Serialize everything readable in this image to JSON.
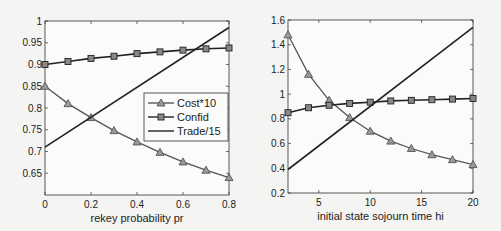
{
  "chart_data": [
    {
      "type": "line",
      "xlabel": "rekey probability pr",
      "ylabel": "",
      "title": "",
      "xlim": [
        0,
        0.8
      ],
      "ylim": [
        0.6,
        1.0
      ],
      "xticks": [
        0,
        0.2,
        0.4,
        0.6,
        0.8
      ],
      "yticks": [
        0.65,
        0.7,
        0.75,
        0.8,
        0.85,
        0.9,
        0.95,
        1
      ],
      "grid": false,
      "legend_position": "inside-right",
      "legend": [
        "Cost*10",
        "Confid",
        "Trade/15"
      ],
      "series": [
        {
          "name": "Cost*10",
          "marker": "triangle",
          "color": "#555555",
          "x": [
            0,
            0.1,
            0.2,
            0.3,
            0.4,
            0.5,
            0.6,
            0.7,
            0.8
          ],
          "values": [
            0.85,
            0.81,
            0.778,
            0.748,
            0.722,
            0.698,
            0.676,
            0.657,
            0.64
          ]
        },
        {
          "name": "Confid",
          "marker": "square",
          "color": "#222222",
          "x": [
            0,
            0.1,
            0.2,
            0.3,
            0.4,
            0.5,
            0.6,
            0.7,
            0.8
          ],
          "values": [
            0.9,
            0.907,
            0.914,
            0.919,
            0.925,
            0.929,
            0.933,
            0.936,
            0.938
          ]
        },
        {
          "name": "Trade/15",
          "marker": "none",
          "color": "#222222",
          "x": [
            0,
            0.8
          ],
          "values": [
            0.71,
            0.985
          ]
        }
      ]
    },
    {
      "type": "line",
      "xlabel": "initial state sojourn time hi",
      "ylabel": "",
      "title": "",
      "xlim": [
        2,
        20
      ],
      "ylim": [
        0.2,
        1.6
      ],
      "xticks": [
        5,
        10,
        15,
        20
      ],
      "yticks": [
        0.2,
        0.4,
        0.6,
        0.8,
        1,
        1.2,
        1.4,
        1.6
      ],
      "grid": false,
      "legend": [],
      "series": [
        {
          "name": "Cost*10",
          "marker": "triangle",
          "color": "#555555",
          "x": [
            2,
            4,
            6,
            8,
            10,
            12,
            14,
            16,
            18,
            20
          ],
          "values": [
            1.48,
            1.16,
            0.95,
            0.81,
            0.7,
            0.62,
            0.56,
            0.51,
            0.47,
            0.43
          ]
        },
        {
          "name": "Confid",
          "marker": "square",
          "color": "#222222",
          "x": [
            2,
            4,
            6,
            8,
            10,
            12,
            14,
            16,
            18,
            20
          ],
          "values": [
            0.85,
            0.89,
            0.91,
            0.925,
            0.935,
            0.945,
            0.95,
            0.955,
            0.96,
            0.965
          ]
        },
        {
          "name": "Trade/15",
          "marker": "none",
          "color": "#222222",
          "x": [
            2,
            20
          ],
          "values": [
            0.39,
            1.54
          ]
        }
      ]
    }
  ],
  "legend": {
    "items": [
      {
        "label": "Cost*10",
        "marker": "triangle"
      },
      {
        "label": "Confid",
        "marker": "square"
      },
      {
        "label": "Trade/15",
        "marker": "none"
      }
    ]
  },
  "left_plot": {
    "xlabel": "rekey probability pr",
    "xtick_labels": [
      "0",
      "0.2",
      "0.4",
      "0.6",
      "0.8"
    ],
    "ytick_labels": [
      "0.65",
      "0.7",
      "0.75",
      "0.8",
      "0.85",
      "0.9",
      "0.95",
      "1"
    ]
  },
  "right_plot": {
    "xlabel": "initial state sojourn time hi",
    "xtick_labels": [
      "5",
      "10",
      "15",
      "20"
    ],
    "ytick_labels": [
      "0.2",
      "0.4",
      "0.6",
      "0.8",
      "1",
      "1.2",
      "1.4",
      "1.6"
    ]
  }
}
